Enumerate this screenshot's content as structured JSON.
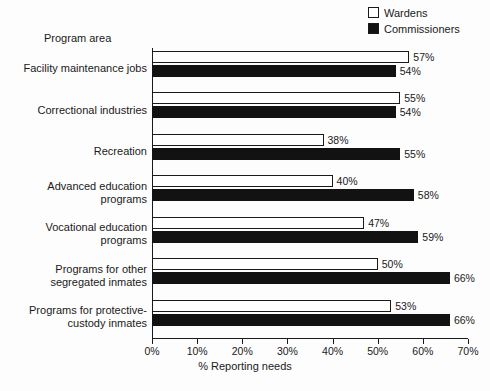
{
  "chart_data": {
    "type": "bar",
    "orientation": "horizontal",
    "title": "",
    "xlabel": "% Reporting needs",
    "ylabel": "Program area",
    "xlim": [
      0,
      70
    ],
    "grid": false,
    "legend_position": "top-right",
    "xticks": [
      "0%",
      "10%",
      "20%",
      "30%",
      "40%",
      "50%",
      "60%",
      "70%"
    ],
    "xtick_values": [
      0,
      10,
      20,
      30,
      40,
      50,
      60,
      70
    ],
    "categories": [
      "Facility maintenance jobs",
      "Correctional industries",
      "Recreation",
      "Advanced education programs",
      "Vocational education programs",
      "Programs for other segregated inmates",
      "Programs for protective-custody inmates"
    ],
    "category_lines": [
      [
        "Facility maintenance jobs"
      ],
      [
        "Correctional industries"
      ],
      [
        "Recreation"
      ],
      [
        "Advanced education",
        "programs"
      ],
      [
        "Vocational education",
        "programs"
      ],
      [
        "Programs for other",
        "segregated inmates"
      ],
      [
        "Programs for protective-",
        "custody inmates"
      ]
    ],
    "series": [
      {
        "name": "Wardens",
        "color": "#ffffff",
        "values": [
          57,
          55,
          38,
          40,
          47,
          50,
          53
        ],
        "labels": [
          "57%",
          "55%",
          "38%",
          "40%",
          "47%",
          "50%",
          "53%"
        ]
      },
      {
        "name": "Commissioners",
        "color": "#121212",
        "values": [
          54,
          54,
          55,
          58,
          59,
          66,
          66
        ],
        "labels": [
          "54%",
          "54%",
          "55%",
          "58%",
          "59%",
          "66%",
          "66%"
        ]
      }
    ]
  },
  "legend": {
    "items": [
      {
        "label": "Wardens",
        "swatch": "open-square"
      },
      {
        "label": "Commissioners",
        "swatch": "filled-square"
      }
    ]
  }
}
